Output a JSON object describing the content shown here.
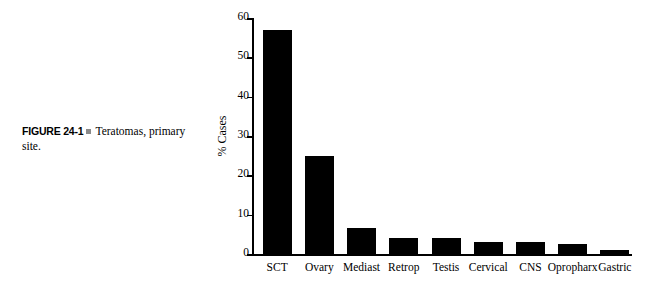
{
  "caption": {
    "figure_label": "FIGURE 24-1",
    "text": "Teratomas, primary site."
  },
  "chart_data": {
    "type": "bar",
    "title": "",
    "xlabel": "",
    "ylabel": "% Cases",
    "categories": [
      "SCT",
      "Ovary",
      "Mediast",
      "Retrop",
      "Testis",
      "Cervical",
      "CNS",
      "Opropharx",
      "Gastric"
    ],
    "values": [
      57,
      25,
      6.5,
      4,
      4,
      3,
      3,
      2.5,
      1
    ],
    "ylim": [
      0,
      60
    ],
    "yticks": [
      0,
      10,
      20,
      30,
      40,
      50,
      60
    ],
    "ytick_labels": [
      "0",
      "10",
      "20",
      "30",
      "40",
      "50",
      "60"
    ],
    "grid": false,
    "legend": "none",
    "bar_color": "#000000",
    "axis_color": "#000000"
  }
}
